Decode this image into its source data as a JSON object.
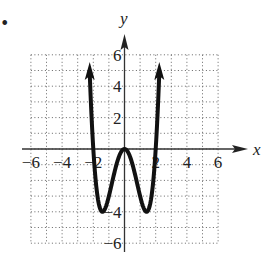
{
  "bullet": "•",
  "chart_data": {
    "type": "line",
    "title": "",
    "xlabel": "x",
    "ylabel": "y",
    "xlim": [
      -6,
      6
    ],
    "ylim": [
      -6,
      6
    ],
    "grid": true,
    "grid_style": "dotted, 1 unit spacing",
    "x_ticks": [
      -6,
      -4,
      -2,
      2,
      4,
      6
    ],
    "y_ticks": [
      6,
      4,
      2,
      -4,
      -6
    ],
    "x_tick_labels": [
      "−6",
      "−4",
      "−2",
      "2",
      "4",
      "6"
    ],
    "y_tick_labels": [
      "6",
      "4",
      "2",
      "−4",
      "−6"
    ],
    "series": [
      {
        "name": "f(x)",
        "description": "W-shaped quartic curve with arrows on both ends pointing up",
        "equation_estimate": "y = x^4 - 4x^2",
        "x": [
          -2.23,
          -2.0,
          -1.8,
          -1.6,
          -1.414,
          -1.2,
          -1.0,
          -0.8,
          -0.6,
          -0.4,
          -0.2,
          0.0,
          0.2,
          0.4,
          0.6,
          0.8,
          1.0,
          1.2,
          1.414,
          1.6,
          1.8,
          2.0,
          2.23
        ],
        "y": [
          4.9,
          0.0,
          -2.46,
          -3.69,
          -4.0,
          -3.69,
          -3.0,
          -2.15,
          -1.31,
          -0.61,
          -0.16,
          0.0,
          -0.16,
          -0.61,
          -1.31,
          -2.15,
          -3.0,
          -3.69,
          -4.0,
          -3.69,
          -2.46,
          0.0,
          4.9
        ],
        "key_points": {
          "local_max": [
            0,
            0
          ],
          "local_min": [
            [
              -1.414,
              -4
            ],
            [
              1.414,
              -4
            ]
          ],
          "x_intercepts": [
            -2,
            0,
            2
          ]
        },
        "end_arrows": true
      }
    ]
  }
}
